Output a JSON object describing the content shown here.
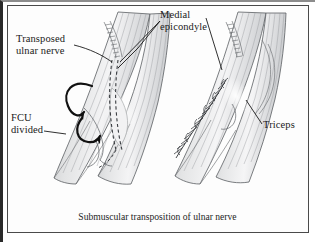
{
  "figure": {
    "title": "Submuscular transposition of ulnar nerve",
    "caption": "Submuscular transposition of ulnar nerve",
    "medium": "grayscale medical line illustration",
    "panels": [
      {
        "name": "left-panel",
        "description": "elbow with ulnar nerve transposed and FCU divided"
      },
      {
        "name": "right-panel",
        "description": "elbow after muscular closure with suture line"
      }
    ],
    "labels": [
      {
        "id": "transposed-ulnar-nerve",
        "text": "Transposed\nulnar nerve"
      },
      {
        "id": "medial-epicondyle",
        "text": "Medial\nepicondyle"
      },
      {
        "id": "fcu-divided",
        "text": "FCU\ndivided"
      },
      {
        "id": "triceps",
        "text": "Triceps"
      }
    ],
    "colors": {
      "background": "#ffffff",
      "frame": "#4a4a4a",
      "scan_edge": "#2a2a2a",
      "ink": "#1a1a1a",
      "line": "#55585c",
      "shade_light": "#e9e9ea",
      "shade_mid": "#cfd0d2",
      "shade_dark": "#a9abae",
      "arrow": "#111111"
    }
  }
}
